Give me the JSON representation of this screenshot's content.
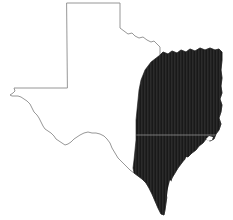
{
  "figure": {
    "name": "texas-shaded-region-map",
    "title": "Texas",
    "background_color": "#ffffff",
    "width": 233,
    "height": 220
  },
  "map": {
    "state_name": "Texas",
    "outline": {
      "name": "texas-state-boundary",
      "stroke_color": "#8b8b8b",
      "fill_color": "#ffffff",
      "stroke_width": 0.9
    },
    "shaded_region": {
      "name": "eastern-southeastern-region",
      "fill_color": "#1a1a1a",
      "texture": "fine vertical hatch",
      "hatch_color": "#3a3a3a",
      "hatch_spacing_px": 1.5,
      "coverage_description": "east and southeast Texas, from the Red River border south along the Gulf coast to the southern tip"
    },
    "divider_line": {
      "name": "horizontal-subdivision-line",
      "color": "#9d9d9d",
      "orientation": "horizontal",
      "y_position_px": 135,
      "description": "faint light horizontal line crossing the shaded region"
    },
    "features": [
      {
        "name": "panhandle",
        "label": "Panhandle",
        "shaded": false
      },
      {
        "name": "west-texas",
        "label": "West Texas",
        "shaded": false
      },
      {
        "name": "rio-grande-border",
        "label": "Rio Grande border",
        "shaded": false
      },
      {
        "name": "red-river-border",
        "label": "Red River border",
        "shaded": false
      },
      {
        "name": "gulf-coast",
        "label": "Gulf Coast",
        "shaded": true
      },
      {
        "name": "southern-tip",
        "label": "Southern tip",
        "shaded": true
      },
      {
        "name": "coastal-inlet",
        "label": "Coastal bay inlet",
        "shaded": false
      }
    ]
  }
}
